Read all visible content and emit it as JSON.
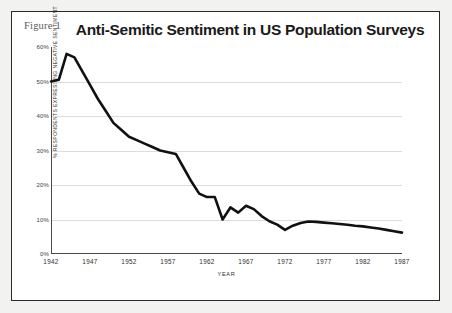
{
  "figure": {
    "label": "Figure 1",
    "title": "Anti-Semitic Sentiment in US Population Surveys",
    "frame_color": "#2a2a2a",
    "background": "#ffffff",
    "page_background": "#f2f2f1"
  },
  "chart_data": {
    "type": "line",
    "title": "Anti-Semitic Sentiment in US Population Surveys",
    "xlabel": "YEAR",
    "ylabel": "% RESPONDENTS EXPRESSING NEGATIVE SENTIMENT",
    "xlim": [
      1942,
      1987
    ],
    "ylim": [
      0,
      60
    ],
    "xticks": [
      1942,
      1947,
      1952,
      1957,
      1962,
      1967,
      1972,
      1977,
      1982,
      1987
    ],
    "xtick_labels": [
      "1942",
      "1947",
      "1952",
      "1957",
      "1962",
      "1967",
      "1972",
      "1977",
      "1982",
      "1987"
    ],
    "yticks": [
      0,
      10,
      20,
      30,
      40,
      50,
      60
    ],
    "ytick_labels": [
      "0%",
      "10%",
      "20%",
      "30%",
      "40%",
      "50%",
      "60%"
    ],
    "grid": true,
    "grid_axis": "y",
    "grid_color": "#dcdcdc",
    "legend": false,
    "line_color": "#111111",
    "line_width": 2.6,
    "x": [
      1942,
      1943,
      1944,
      1945,
      1946,
      1947,
      1948,
      1949,
      1950,
      1951,
      1952,
      1953,
      1954,
      1955,
      1956,
      1957,
      1958,
      1959,
      1960,
      1961,
      1962,
      1963,
      1964,
      1965,
      1966,
      1967,
      1968,
      1969,
      1970,
      1971,
      1972,
      1973,
      1974,
      1975,
      1976,
      1977,
      1978,
      1979,
      1980,
      1981,
      1982,
      1983,
      1984,
      1985,
      1986,
      1987
    ],
    "y": [
      50.0,
      50.5,
      58.0,
      57.0,
      53.0,
      49.0,
      45.0,
      41.5,
      38.0,
      36.0,
      34.0,
      33.0,
      32.0,
      31.0,
      30.0,
      29.5,
      29.0,
      25.0,
      21.0,
      17.5,
      16.5,
      16.5,
      10.0,
      13.5,
      12.0,
      14.0,
      13.0,
      11.0,
      9.5,
      8.5,
      7.0,
      8.2,
      9.0,
      9.4,
      9.3,
      9.1,
      8.9,
      8.7,
      8.5,
      8.2,
      8.0,
      7.7,
      7.4,
      7.0,
      6.6,
      6.2
    ]
  }
}
